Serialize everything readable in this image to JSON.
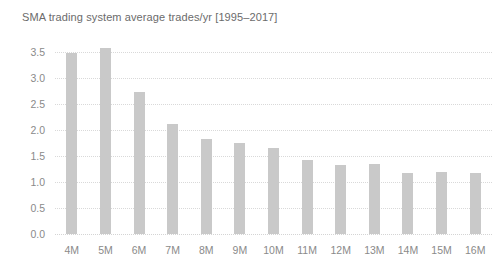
{
  "chart_data": {
    "type": "bar",
    "title": "SMA trading system average trades/yr [1995–2017]",
    "xlabel": "",
    "ylabel": "",
    "categories": [
      "4M",
      "5M",
      "6M",
      "7M",
      "8M",
      "9M",
      "10M",
      "11M",
      "12M",
      "13M",
      "14M",
      "15M",
      "16M"
    ],
    "values": [
      3.48,
      3.58,
      2.74,
      2.12,
      1.82,
      1.75,
      1.65,
      1.42,
      1.33,
      1.35,
      1.17,
      1.19,
      1.18
    ],
    "ylim": [
      0.0,
      3.75
    ],
    "yticks": [
      0.0,
      0.5,
      1.0,
      1.5,
      2.0,
      2.5,
      3.0,
      3.5
    ],
    "ytick_labels": [
      "0.0",
      "0.5",
      "1.0",
      "1.5",
      "2.0",
      "2.5",
      "3.0",
      "3.5"
    ],
    "grid": true,
    "grid_axis": "y",
    "grid_style": "dotted",
    "legend": false,
    "legend_position": "none",
    "bar_color": "#c9c9c9",
    "grid_color": "#d9d9d9",
    "text_color": "#8a8a8a",
    "title_color": "#6b6b6b",
    "background_color": "#ffffff"
  }
}
